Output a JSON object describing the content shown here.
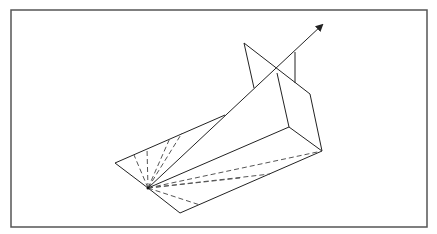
{
  "diagram": {
    "type": "geometric-3d-line-drawing",
    "stroke_color": "#222222",
    "frame_color": "#555555",
    "background": "#ffffff",
    "frame": {
      "x": 11,
      "y": 10,
      "w": 416,
      "h": 217
    },
    "apex": {
      "x": 148,
      "y": 188
    },
    "arrow": {
      "from": [
        148,
        188
      ],
      "to": [
        322,
        25
      ]
    },
    "solid_lines": [
      [
        [
          115,
          163
        ],
        [
          148,
          188
        ]
      ],
      [
        [
          115,
          163
        ],
        [
          225,
          115
        ]
      ],
      [
        [
          148,
          188
        ],
        [
          180,
          213
        ]
      ],
      [
        [
          180,
          213
        ],
        [
          322,
          151
        ]
      ],
      [
        [
          148,
          188
        ],
        [
          289,
          127
        ]
      ],
      [
        [
          289,
          127
        ],
        [
          322,
          151
        ]
      ],
      [
        [
          289,
          127
        ],
        [
          277,
          73
        ]
      ],
      [
        [
          244,
          43
        ],
        [
          310,
          94
        ]
      ],
      [
        [
          310,
          94
        ],
        [
          322,
          151
        ]
      ],
      [
        [
          244,
          43
        ],
        [
          254,
          88
        ]
      ],
      [
        [
          295,
          52
        ],
        [
          295,
          83
        ]
      ]
    ],
    "dashed_lines": [
      [
        [
          148,
          188
        ],
        [
          134,
          155
        ]
      ],
      [
        [
          148,
          188
        ],
        [
          147,
          148
        ]
      ],
      [
        [
          148,
          188
        ],
        [
          170,
          138
        ]
      ],
      [
        [
          148,
          188
        ],
        [
          182,
          133
        ]
      ],
      [
        [
          148,
          188
        ],
        [
          322,
          151
        ]
      ],
      [
        [
          148,
          188
        ],
        [
          270,
          174
        ]
      ],
      [
        [
          148,
          188
        ],
        [
          200,
          205
        ]
      ],
      [
        [
          148,
          188
        ],
        [
          240,
          178
        ]
      ]
    ]
  }
}
